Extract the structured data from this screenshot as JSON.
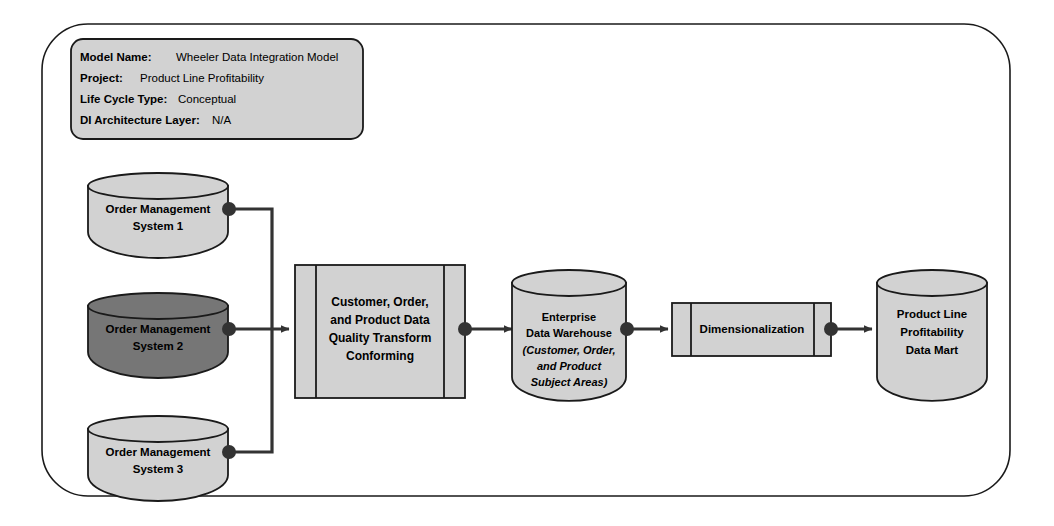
{
  "diagram": {
    "header_box": {
      "rows": [
        {
          "key": "Model Name:",
          "value": "Wheeler Data Integration Model"
        },
        {
          "key": "Project:",
          "value": "Product Line Profitability"
        },
        {
          "key": "Life Cycle Type:",
          "value": "Conceptual"
        },
        {
          "key": "DI Architecture Layer:",
          "value": "N/A"
        }
      ]
    },
    "colors": {
      "canvas_background": "#ffffff",
      "frame_stroke": "#1a1a1a",
      "shape_fill_light": "#d2d2d2",
      "shape_fill_dark": "#767676",
      "header_fill": "#d2d2d2",
      "connector": "#333333",
      "text": "#000000"
    },
    "sources": [
      {
        "id": "oms1",
        "lines": [
          "Order Management",
          "System 1"
        ],
        "fill": "light"
      },
      {
        "id": "oms2",
        "lines": [
          "Order Management",
          "System 2"
        ],
        "fill": "dark"
      },
      {
        "id": "oms3",
        "lines": [
          "Order Management",
          "System 3"
        ],
        "fill": "light"
      }
    ],
    "processes": [
      {
        "id": "transform",
        "lines": [
          "Customer, Order,",
          "and Product Data",
          "Quality Transform",
          "Conforming"
        ]
      },
      {
        "id": "dimensionalization",
        "lines": [
          "Dimensionalization"
        ]
      }
    ],
    "stores": [
      {
        "id": "edw",
        "lines": [
          {
            "text": "Enterprise",
            "italic": false
          },
          {
            "text": "Data Warehouse",
            "italic": false
          },
          {
            "text": "(Customer, Order,",
            "italic": true
          },
          {
            "text": "and Product",
            "italic": true
          },
          {
            "text": "Subject Areas)",
            "italic": true
          }
        ]
      },
      {
        "id": "datamart",
        "lines": [
          {
            "text": "Product Line",
            "italic": false
          },
          {
            "text": "Profitability",
            "italic": false
          },
          {
            "text": "Data Mart",
            "italic": false
          }
        ]
      }
    ],
    "flows": [
      {
        "from": "oms1",
        "to": "transform"
      },
      {
        "from": "oms2",
        "to": "transform"
      },
      {
        "from": "oms3",
        "to": "transform"
      },
      {
        "from": "transform",
        "to": "edw"
      },
      {
        "from": "edw",
        "to": "dimensionalization"
      },
      {
        "from": "dimensionalization",
        "to": "datamart"
      }
    ]
  }
}
